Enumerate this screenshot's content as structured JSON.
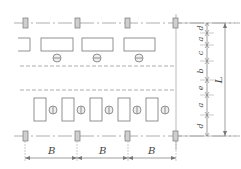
{
  "diagram": {
    "type": "plan-layout-with-dimensions",
    "colors": {
      "line": "#888888",
      "column_fill": "#cfcfcf",
      "column_stroke": "#777777",
      "dashed": "#9a9a9a",
      "text": "#444444"
    },
    "columns": {
      "x_positions": [
        25,
        77,
        128,
        176
      ],
      "top_row_y": 22,
      "bottom_row_y": 136
    },
    "upper_equipment": {
      "orientation": "horizontal",
      "count_full": 3,
      "partial_at_left": true
    },
    "lower_equipment": {
      "orientation": "vertical",
      "count": 5
    },
    "horizontal_dimensions": {
      "labels": [
        "B",
        "B",
        "B"
      ]
    },
    "vertical_dimensions": {
      "labels_top_to_bottom": [
        "d",
        "a",
        "c",
        "b",
        "e",
        "a",
        "d"
      ],
      "overall_label": "L"
    }
  }
}
